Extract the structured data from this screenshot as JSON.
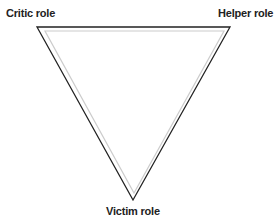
{
  "diagram": {
    "type": "drama-triangle",
    "shape": "inverted-triangle",
    "labels": {
      "top_left": "Critic role",
      "top_right": "Helper role",
      "bottom": "Victim role"
    },
    "colors": {
      "outline": "#222222",
      "inner_shadow": "#cccccc",
      "background": "#ffffff"
    }
  }
}
